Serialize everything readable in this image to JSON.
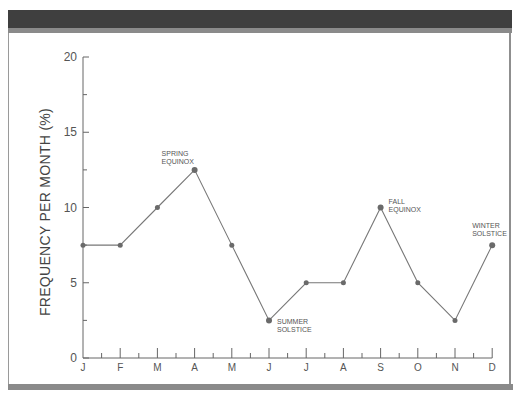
{
  "chart_data": {
    "type": "line",
    "title": "",
    "xlabel": "",
    "ylabel": "FREQUENCY PER MONTH (%)",
    "categories": [
      "J",
      "F",
      "M",
      "A",
      "M",
      "J",
      "J",
      "A",
      "S",
      "O",
      "N",
      "D"
    ],
    "series": [
      {
        "name": "Frequency",
        "values": [
          7.5,
          7.5,
          10,
          12.5,
          7.5,
          2.5,
          5,
          5,
          10,
          5,
          2.5,
          7.5
        ]
      }
    ],
    "ylim": [
      0,
      20
    ],
    "yticks": [
      0,
      5,
      10,
      15,
      20
    ],
    "grid": false,
    "legend": null,
    "annotations": [
      {
        "label_lines": [
          "SPRING",
          "EQUINOX"
        ],
        "category_index": 3
      },
      {
        "label_lines": [
          "SUMMER",
          "SOLSTICE"
        ],
        "category_index": 5
      },
      {
        "label_lines": [
          "FALL",
          "EQUINOX"
        ],
        "category_index": 8
      },
      {
        "label_lines": [
          "WINTER",
          "SOLSTICE"
        ],
        "category_index": 11
      }
    ]
  },
  "colors": {
    "line": "#777777",
    "marker": "#6a6a6a",
    "axis": "#666666",
    "header_bar": "#3f3f3f",
    "frame": "#8a8a8a"
  }
}
